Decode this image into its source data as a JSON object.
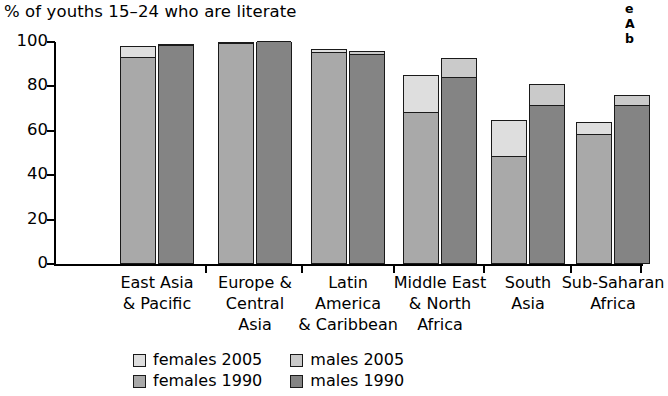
{
  "chart_data": {
    "type": "bar",
    "title": "% of youths 15–24 who are literate",
    "xlabel": "",
    "ylabel": "",
    "ylim": [
      0,
      100
    ],
    "yticks": [
      0,
      20,
      40,
      60,
      80,
      100
    ],
    "ytick_labels": [
      "0",
      "20",
      "40",
      "60",
      "80",
      "100"
    ],
    "grid": false,
    "stacked": true,
    "legend_position": "bottom",
    "categories": [
      "East Asia & Pacific",
      "Europe & Central Asia",
      "Latin America & Caribbean",
      "Middle East & North Africa",
      "South Asia",
      "Sub-Saharan Africa"
    ],
    "category_label_lines": [
      [
        "East Asia",
        "& Pacific"
      ],
      [
        "Europe &",
        "Central",
        "Asia"
      ],
      [
        "Latin",
        "America",
        "& Caribbean"
      ],
      [
        "Middle East",
        "& North",
        "Africa"
      ],
      [
        "South",
        "Asia"
      ],
      [
        "Sub-Saharan",
        "Africa"
      ]
    ],
    "series": [
      {
        "name": "females 1990",
        "color": "#a9a9a9",
        "values": [
          93,
          99,
          95,
          68,
          48,
          58
        ]
      },
      {
        "name": "females 2005",
        "color": "#dedede",
        "values": [
          98,
          100,
          97,
          85,
          65,
          64
        ]
      },
      {
        "name": "males 1990",
        "color": "#848484",
        "values": [
          98,
          100,
          94,
          84,
          71,
          71
        ]
      },
      {
        "name": "males 2005",
        "color": "#cacaca",
        "values": [
          99,
          100,
          96,
          93,
          81,
          76
        ]
      }
    ],
    "legend": [
      {
        "label": "females 2005",
        "color": "#dedede"
      },
      {
        "label": "males 2005",
        "color": "#cacaca"
      },
      {
        "label": "females 1990",
        "color": "#a9a9a9"
      },
      {
        "label": "males 1990",
        "color": "#848484"
      }
    ]
  },
  "margin_note": {
    "line1": "e",
    "line2": "A",
    "line3": "b"
  }
}
